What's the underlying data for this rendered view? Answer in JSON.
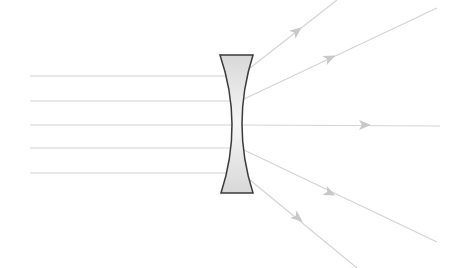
{
  "diagram": {
    "colors": {
      "background": "#ffffff",
      "ray": "#d4d4d4",
      "arrow": "#c8c8c8",
      "lens_fill": "#e2e2e2",
      "lens_stroke": "#3a3a3a"
    },
    "lens": {
      "type": "biconcave",
      "top_y": 55,
      "bottom_y": 193,
      "top_left_x": 220,
      "top_right_x": 253,
      "bottom_left_x": 221,
      "bottom_right_x": 253,
      "waist_left_x": 232,
      "waist_right_x": 242
    },
    "incident_rays": [
      {
        "x1": 30,
        "y1": 76,
        "x2": 230,
        "y2": 76
      },
      {
        "x1": 30,
        "y1": 101,
        "x2": 236,
        "y2": 101
      },
      {
        "x1": 30,
        "y1": 125,
        "x2": 238,
        "y2": 125
      },
      {
        "x1": 30,
        "y1": 148,
        "x2": 236,
        "y2": 148
      },
      {
        "x1": 30,
        "y1": 173,
        "x2": 230,
        "y2": 173
      }
    ],
    "refracted_rays": [
      {
        "x1": 250,
        "y1": 68,
        "x2": 337,
        "y2": 0,
        "arrow": {
          "x": 297,
          "y": 31
        }
      },
      {
        "x1": 244,
        "y1": 99,
        "x2": 437,
        "y2": 8,
        "arrow": {
          "x": 330,
          "y": 58
        }
      },
      {
        "x1": 238,
        "y1": 125,
        "x2": 440,
        "y2": 126,
        "arrow": {
          "x": 365,
          "y": 125
        }
      },
      {
        "x1": 244,
        "y1": 150,
        "x2": 437,
        "y2": 242,
        "arrow": {
          "x": 330,
          "y": 193
        }
      },
      {
        "x1": 250,
        "y1": 180,
        "x2": 357,
        "y2": 268,
        "arrow": {
          "x": 298,
          "y": 218
        }
      }
    ]
  }
}
